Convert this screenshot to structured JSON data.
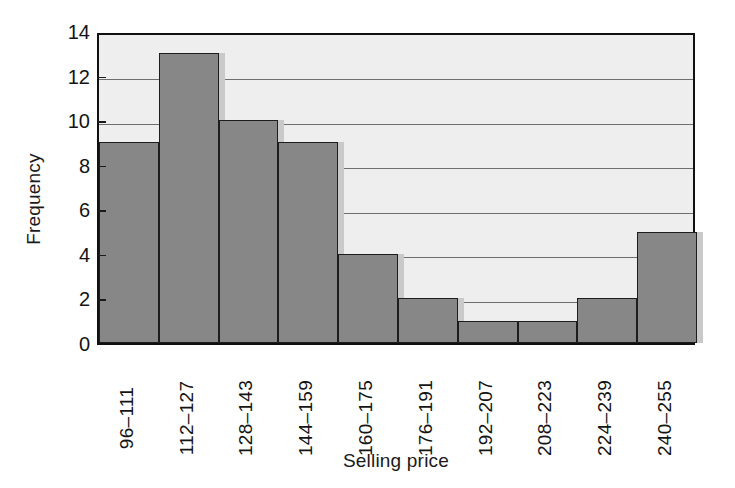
{
  "chart_data": {
    "type": "bar",
    "title": "",
    "subtitle": "",
    "xlabel": "Selling price",
    "ylabel": "Frequency",
    "categories": [
      "96–111",
      "112–127",
      "128–143",
      "144–159",
      "160–175",
      "176–191",
      "192–207",
      "208–223",
      "224–239",
      "240–255"
    ],
    "values": [
      9,
      13,
      10,
      9,
      4,
      2,
      1,
      1,
      2,
      5
    ],
    "ylim": [
      0,
      14
    ],
    "xlim_note": "categorical bins, contiguous histogram bars",
    "yticks": [
      0,
      2,
      4,
      6,
      8,
      10,
      12,
      14
    ],
    "ytick_labels": [
      "0",
      "2",
      "4",
      "6",
      "8",
      "10",
      "12",
      "14"
    ],
    "grid": "horizontal gridlines at every y tick",
    "legend": "none",
    "legend_position": "none",
    "annotations": [],
    "style": {
      "bar_fill": "#878787",
      "bar_edge": "#1d1d1d",
      "bar_shadow": "#c9c9c9",
      "plot_background": "#eeeeee",
      "grid_color": "#6e6e6e",
      "frame_color": "#111111",
      "text_color": "#141414",
      "xtick_rotation_deg": -90
    }
  }
}
